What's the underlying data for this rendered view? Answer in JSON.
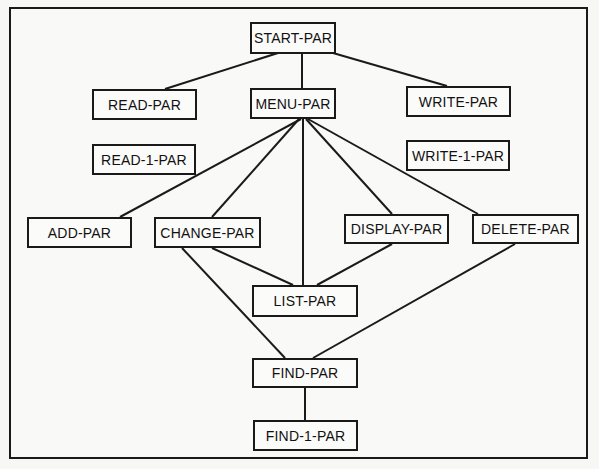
{
  "diagram": {
    "type": "structure-chart",
    "nodes": [
      {
        "id": "start",
        "label": "START-PAR",
        "x": 250,
        "y": 22,
        "w": 86,
        "h": 32
      },
      {
        "id": "read",
        "label": "READ-PAR",
        "x": 92,
        "y": 89,
        "w": 105,
        "h": 31
      },
      {
        "id": "menu",
        "label": "MENU-PAR",
        "x": 250,
        "y": 88,
        "w": 86,
        "h": 31
      },
      {
        "id": "write",
        "label": "WRITE-PAR",
        "x": 406,
        "y": 86,
        "w": 105,
        "h": 31
      },
      {
        "id": "read1",
        "label": "READ-1-PAR",
        "x": 92,
        "y": 144,
        "w": 104,
        "h": 31
      },
      {
        "id": "write1",
        "label": "WRITE-1-PAR",
        "x": 406,
        "y": 140,
        "w": 104,
        "h": 31
      },
      {
        "id": "add",
        "label": "ADD-PAR",
        "x": 27,
        "y": 217,
        "w": 105,
        "h": 31
      },
      {
        "id": "change",
        "label": "CHANGE-PAR",
        "x": 154,
        "y": 217,
        "w": 107,
        "h": 31
      },
      {
        "id": "display",
        "label": "DISPLAY-PAR",
        "x": 344,
        "y": 214,
        "w": 105,
        "h": 30
      },
      {
        "id": "delete",
        "label": "DELETE-PAR",
        "x": 472,
        "y": 214,
        "w": 107,
        "h": 30
      },
      {
        "id": "list",
        "label": "LIST-PAR",
        "x": 252,
        "y": 285,
        "w": 106,
        "h": 32
      },
      {
        "id": "find",
        "label": "FIND-PAR",
        "x": 252,
        "y": 358,
        "w": 106,
        "h": 30
      },
      {
        "id": "find1",
        "label": "FIND-1-PAR",
        "x": 253,
        "y": 420,
        "w": 105,
        "h": 31
      }
    ],
    "edges": [
      {
        "from": "start",
        "to": "read",
        "x1": 278,
        "y1": 53,
        "x2": 165,
        "y2": 89
      },
      {
        "from": "start",
        "to": "menu",
        "x1": 302,
        "y1": 53,
        "x2": 302,
        "y2": 88
      },
      {
        "from": "start",
        "to": "write",
        "x1": 333,
        "y1": 53,
        "x2": 447,
        "y2": 86
      },
      {
        "from": "menu",
        "to": "add",
        "x1": 301,
        "y1": 119,
        "x2": 120,
        "y2": 217
      },
      {
        "from": "menu",
        "to": "change",
        "x1": 299,
        "y1": 119,
        "x2": 212,
        "y2": 217
      },
      {
        "from": "menu",
        "to": "list",
        "x1": 303,
        "y1": 119,
        "x2": 303,
        "y2": 285
      },
      {
        "from": "menu",
        "to": "display",
        "x1": 306,
        "y1": 119,
        "x2": 392,
        "y2": 214
      },
      {
        "from": "menu",
        "to": "delete",
        "x1": 308,
        "y1": 119,
        "x2": 478,
        "y2": 214
      },
      {
        "from": "change",
        "to": "list",
        "x1": 212,
        "y1": 248,
        "x2": 293,
        "y2": 285
      },
      {
        "from": "change",
        "to": "find",
        "x1": 182,
        "y1": 248,
        "x2": 285,
        "y2": 358
      },
      {
        "from": "display",
        "to": "list",
        "x1": 392,
        "y1": 244,
        "x2": 317,
        "y2": 285
      },
      {
        "from": "delete",
        "to": "find",
        "x1": 515,
        "y1": 244,
        "x2": 313,
        "y2": 358
      },
      {
        "from": "find",
        "to": "find1",
        "x1": 305,
        "y1": 388,
        "x2": 305,
        "y2": 420
      }
    ]
  }
}
